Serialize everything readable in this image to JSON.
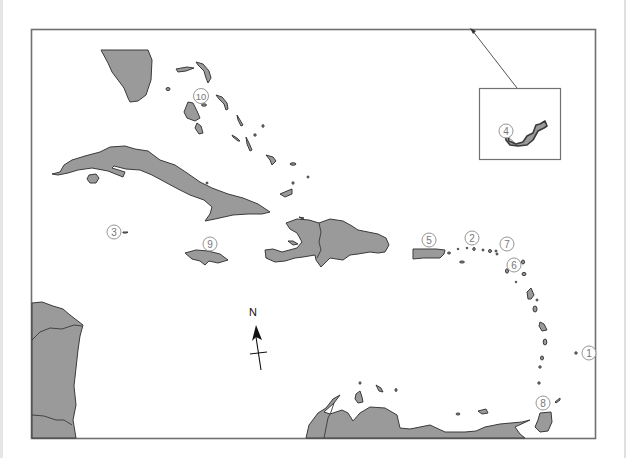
{
  "map": {
    "title": "Caribbean region outline map",
    "colors": {
      "land": "#9a9a9a",
      "outline": "#3a3a3a",
      "frame": "#707070",
      "label": "#777777"
    },
    "labels": [
      {
        "id": 1,
        "text": "1",
        "x": 589,
        "y": 353
      },
      {
        "id": 2,
        "text": "2",
        "x": 472,
        "y": 238
      },
      {
        "id": 3,
        "text": "3",
        "x": 114,
        "y": 232
      },
      {
        "id": 4,
        "text": "4",
        "x": 506,
        "y": 131
      },
      {
        "id": 5,
        "text": "5",
        "x": 429,
        "y": 240
      },
      {
        "id": 6,
        "text": "6",
        "x": 514,
        "y": 265
      },
      {
        "id": 7,
        "text": "7",
        "x": 507,
        "y": 244
      },
      {
        "id": 8,
        "text": "8",
        "x": 543,
        "y": 403
      },
      {
        "id": 9,
        "text": "9",
        "x": 210,
        "y": 244
      },
      {
        "id": 10,
        "text": "10",
        "x": 201,
        "y": 96
      }
    ],
    "compass": {
      "label": "N",
      "icon": "north-arrow-icon"
    },
    "inset": {
      "name": "Bermuda inset",
      "label_ref": "4"
    }
  }
}
